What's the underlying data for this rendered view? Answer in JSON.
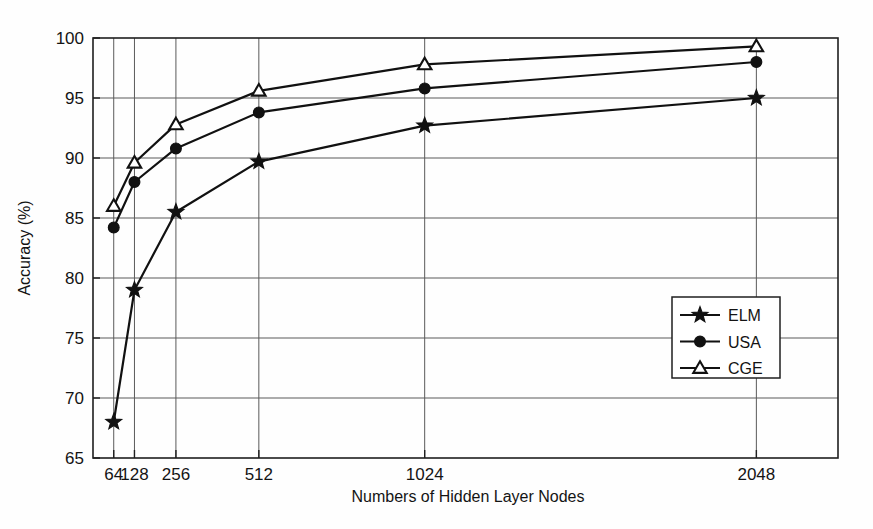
{
  "chart_data": {
    "type": "line",
    "title": "",
    "xlabel": "Numbers of Hidden Layer Nodes",
    "ylabel": "Accuracy (%)",
    "x": [
      64,
      128,
      256,
      512,
      1024,
      2048
    ],
    "xtick_labels": [
      "64",
      "128",
      "256",
      "512",
      "1024",
      "2048"
    ],
    "ytick_labels": [
      "65",
      "70",
      "75",
      "80",
      "85",
      "90",
      "95",
      "100"
    ],
    "yticks": [
      65,
      70,
      75,
      80,
      85,
      90,
      95,
      100
    ],
    "ylim": [
      65,
      100
    ],
    "xlim": [
      0,
      2300
    ],
    "grid": true,
    "legend_position": "center-right",
    "series": [
      {
        "name": "ELM",
        "marker": "star",
        "values": [
          68.0,
          79.0,
          85.5,
          89.7,
          92.7,
          95.0
        ]
      },
      {
        "name": "USA",
        "marker": "circle",
        "values": [
          84.2,
          88.0,
          90.8,
          93.8,
          95.8,
          98.0
        ]
      },
      {
        "name": "CGE",
        "marker": "triangle",
        "values": [
          86.0,
          89.6,
          92.8,
          95.6,
          97.8,
          99.3
        ]
      }
    ]
  },
  "colors": {
    "background": "#fefefe",
    "axis": "#1f1f1f",
    "grid": "#5a5a5a",
    "series": "#111111"
  },
  "legend": {
    "entries": [
      {
        "label": "ELM",
        "marker": "star"
      },
      {
        "label": "USA",
        "marker": "circle"
      },
      {
        "label": "CGE",
        "marker": "triangle"
      }
    ]
  }
}
